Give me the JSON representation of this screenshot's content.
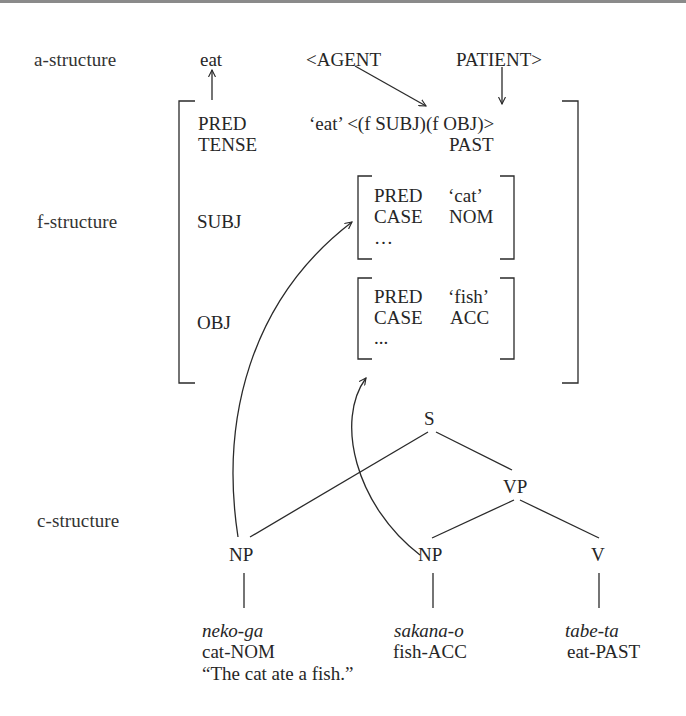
{
  "levels": {
    "a_structure": "a-structure",
    "f_structure": "f-structure",
    "c_structure": "c-structure"
  },
  "a_structure": {
    "predicate": "eat",
    "agent": "<AGENT",
    "patient": "PATIENT>"
  },
  "f_structure": {
    "pred_attr": "PRED",
    "pred_value": "‘eat’ <(f SUBJ)(f OBJ)>",
    "tense_attr": "TENSE",
    "tense_value": "PAST",
    "subj_attr": "SUBJ",
    "obj_attr": "OBJ",
    "subj": {
      "pred_attr": "PRED",
      "pred_value": "‘cat’",
      "case_attr": "CASE",
      "case_value": "NOM",
      "ellipsis": "…"
    },
    "obj": {
      "pred_attr": "PRED",
      "pred_value": "‘fish’",
      "case_attr": "CASE",
      "case_value": "ACC",
      "ellipsis": "..."
    }
  },
  "c_structure": {
    "nodes": {
      "s": "S",
      "vp": "VP",
      "np1": "NP",
      "np2": "NP",
      "v": "V"
    },
    "words": [
      {
        "form": "neko-ga",
        "gloss": "cat-NOM"
      },
      {
        "form": "sakana-o",
        "gloss": "fish-ACC"
      },
      {
        "form": "tabe-ta",
        "gloss": "eat-PAST"
      }
    ],
    "translation": "“The cat ate a fish.”"
  },
  "colors": {
    "ink": "#262626",
    "top_border": "#8a8a8a",
    "background": "#ffffff"
  }
}
